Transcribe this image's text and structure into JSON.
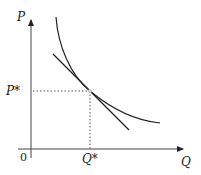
{
  "diagram": {
    "title": "",
    "axes": {
      "y_label": "P",
      "x_label": "Q",
      "origin_label": "0"
    },
    "markers": {
      "p_star": "P*",
      "q_star": "Q*"
    },
    "elements": [
      {
        "type": "curve",
        "description": "downward-sloping convex demand curve"
      },
      {
        "type": "line",
        "description": "tangent line touching curve at (Q*, P*)"
      },
      {
        "type": "dotted-guides",
        "description": "dotted lines from point to axes at P* and Q*"
      }
    ],
    "colors": {
      "ink": "#222222",
      "guide": "#555555",
      "background": "#ffffff"
    }
  }
}
